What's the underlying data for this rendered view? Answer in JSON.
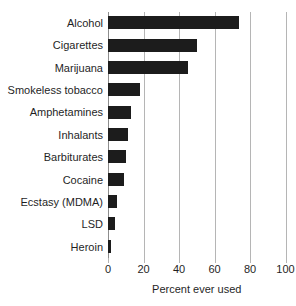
{
  "chart_data": {
    "type": "bar",
    "orientation": "horizontal",
    "title": "",
    "subtitle": "",
    "xlabel": "Percent ever used",
    "ylabel": "",
    "xlim": [
      0,
      100
    ],
    "xticks": [
      0,
      20,
      40,
      60,
      80,
      100
    ],
    "xtick_labels": [
      "0",
      "20",
      "40",
      "60",
      "80",
      "100"
    ],
    "grid": "vertical",
    "legend": null,
    "bar_color": "#1c1c1c",
    "gridline_color": "#b5b5b5",
    "background_color": "#ffffff",
    "categories": [
      "Alcohol",
      "Cigarettes",
      "Marijuana",
      "Smokeless tobacco",
      "Amphetamines",
      "Inhalants",
      "Barbiturates",
      "Cocaine",
      "Ecstasy (MDMA)",
      "LSD",
      "Heroin"
    ],
    "values": [
      74,
      50,
      45,
      18,
      13,
      11,
      10,
      9,
      5,
      4,
      1.5
    ]
  }
}
